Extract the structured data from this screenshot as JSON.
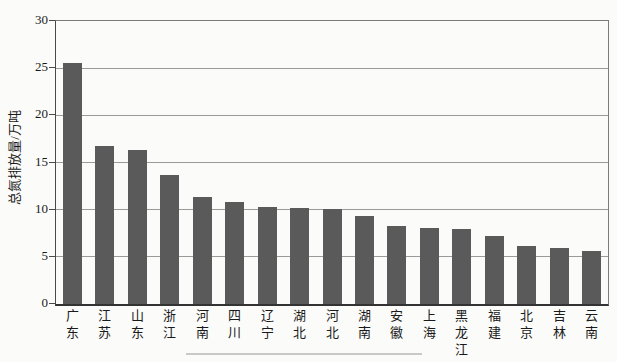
{
  "chart_data": {
    "type": "bar",
    "title": "",
    "xlabel": "",
    "ylabel": "总氮排放量/万吨",
    "categories": [
      "广东",
      "江苏",
      "山东",
      "浙江",
      "河南",
      "四川",
      "辽宁",
      "湖北",
      "河北",
      "湖南",
      "安徽",
      "上海",
      "黑龙江",
      "福建",
      "北京",
      "吉林",
      "云南"
    ],
    "values": [
      25.5,
      16.7,
      16.3,
      13.7,
      11.3,
      10.8,
      10.3,
      10.2,
      10.1,
      9.3,
      8.3,
      8.1,
      8.0,
      7.2,
      6.1,
      5.9,
      5.6
    ],
    "ylim": [
      0,
      30
    ],
    "yticks": [
      0,
      5,
      10,
      15,
      20,
      25,
      30
    ],
    "grid": "horizontal",
    "legend": "none",
    "bar_color": "#5a5a5a",
    "gridline_color": "#9a9a9a",
    "axis_color": "#4a4a4a",
    "text_color": "#1a1a1a"
  }
}
